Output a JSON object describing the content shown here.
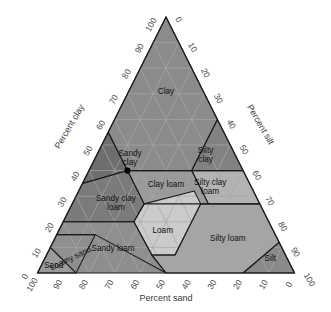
{
  "figure": {
    "kind": "soil-texture-triangle",
    "axes": {
      "bottom": {
        "title": "Percent sand",
        "ticks": [
          "100",
          "90",
          "80",
          "70",
          "60",
          "50",
          "40",
          "30",
          "20",
          "10",
          "0"
        ]
      },
      "left": {
        "title": "Percent clay",
        "ticks": [
          "0",
          "10",
          "20",
          "30",
          "40",
          "50",
          "60",
          "70",
          "80",
          "90",
          "100"
        ]
      },
      "right": {
        "title": "Percent silt",
        "ticks": [
          "0",
          "10",
          "20",
          "30",
          "40",
          "50",
          "60",
          "70",
          "80",
          "90",
          "100"
        ]
      }
    },
    "point": {
      "label": "A",
      "sand": 45,
      "silt": 15,
      "clay": 40
    },
    "colors": {
      "base": "#8e8e8e",
      "dark": "#6f6f6f",
      "mid": "#8a8a8a",
      "light": "#b9b9b9",
      "lightest": "#cfcfcf",
      "grid": "#a8a8a8",
      "outline": "#1d1d1d",
      "text": "#111111"
    }
  },
  "classes": [
    {
      "name": "Clay",
      "label": "Clay",
      "fill": "#8b8b8b",
      "lx": 0.5,
      "ly": 0.7,
      "lines": 1
    },
    {
      "name": "Sandy clay",
      "label": "Sandy clay",
      "fill": "#6e6e6e",
      "lx": 0.25,
      "ly": 0.44,
      "lines": 2
    },
    {
      "name": "Silty clay",
      "label": "Silty clay",
      "fill": "#828282",
      "lx": 0.78,
      "ly": 0.45,
      "lines": 2
    },
    {
      "name": "Clay loam",
      "label": "Clay loam",
      "fill": "#9a9a9a",
      "lx": 0.5,
      "ly": 0.335,
      "lines": 1
    },
    {
      "name": "Silty clay loam",
      "label": "Silty clay loam",
      "fill": "#b3b3b3",
      "lx": 0.755,
      "ly": 0.325,
      "lines": 2
    },
    {
      "name": "Sandy clay loam",
      "label": "Sandy clay loam",
      "fill": "#7b7b7b",
      "lx": 0.235,
      "ly": 0.265,
      "lines": 2
    },
    {
      "name": "Loam",
      "label": "Loam",
      "fill": "#cbcbcb",
      "lx": 0.485,
      "ly": 0.155,
      "lines": 1
    },
    {
      "name": "Silty loam",
      "label": "Silty loam",
      "fill": "#a5a5a5",
      "lx": 0.775,
      "ly": 0.125,
      "lines": 1
    },
    {
      "name": "Sandy loam",
      "label": "Sandy loam",
      "fill": "#8f8f8f",
      "lx": 0.275,
      "ly": 0.085,
      "lines": 1
    },
    {
      "name": "Silt",
      "label": "Silt",
      "fill": "#8a8a8a",
      "lx": 0.925,
      "ly": 0.045,
      "lines": 1
    },
    {
      "name": "Loamy sand",
      "label": "Loamy sand",
      "fill": "#8f8f8f",
      "lx": 0.115,
      "ly": 0.048,
      "lines": 1,
      "rot": -26
    },
    {
      "name": "Sand",
      "label": "Sand",
      "fill": "#9a9a9a",
      "lx": 0.055,
      "ly": 0.018,
      "lines": 1
    }
  ],
  "chart_data": {
    "type": "scatter",
    "title": "",
    "xlabel": "Percent sand",
    "ylabel": "Percent clay",
    "zlabel": "Percent silt",
    "ternary": true,
    "axis_ranges": {
      "sand": [
        0,
        100
      ],
      "silt": [
        0,
        100
      ],
      "clay": [
        0,
        100
      ]
    },
    "gridline_step": 10,
    "grid": true,
    "legend": "none",
    "points": [
      {
        "name": "A",
        "sand": 45,
        "silt": 15,
        "clay": 40
      }
    ],
    "regions": [
      {
        "name": "Clay",
        "vertices": [
          [
            0,
            0,
            100
          ],
          [
            0,
            40,
            60
          ],
          [
            20,
            40,
            40
          ],
          [
            45,
            15,
            40
          ],
          [
            45,
            0,
            55
          ]
        ]
      },
      {
        "name": "Sandy clay",
        "vertices": [
          [
            45,
            0,
            55
          ],
          [
            45,
            15,
            40
          ],
          [
            65,
            0,
            35
          ]
        ]
      },
      {
        "name": "Silty clay",
        "vertices": [
          [
            0,
            40,
            60
          ],
          [
            0,
            60,
            40
          ],
          [
            20,
            40,
            40
          ]
        ]
      },
      {
        "name": "Silty clay loam",
        "vertices": [
          [
            0,
            60,
            40
          ],
          [
            0,
            73,
            27
          ],
          [
            20,
            53,
            27
          ],
          [
            20,
            40,
            40
          ]
        ]
      },
      {
        "name": "Clay loam",
        "vertices": [
          [
            20,
            40,
            40
          ],
          [
            20,
            53,
            27
          ],
          [
            45,
            28,
            27
          ],
          [
            45,
            15,
            40
          ]
        ]
      },
      {
        "name": "Sandy clay loam",
        "vertices": [
          [
            45,
            15,
            40
          ],
          [
            45,
            28,
            27
          ],
          [
            52.5,
            27.5,
            20
          ],
          [
            80,
            0,
            20
          ],
          [
            65,
            0,
            35
          ]
        ]
      },
      {
        "name": "Loam",
        "vertices": [
          [
            23,
            45,
            32
          ],
          [
            45,
            28,
            27
          ],
          [
            52.5,
            27.5,
            20
          ],
          [
            52,
            41,
            7
          ],
          [
            43,
            50,
            7
          ],
          [
            23,
            50,
            27
          ]
        ]
      },
      {
        "name": "Silty loam",
        "vertices": [
          [
            0,
            73,
            27
          ],
          [
            0,
            88,
            12
          ],
          [
            20,
            80,
            0
          ],
          [
            50,
            50,
            0
          ],
          [
            52,
            41,
            7
          ],
          [
            43,
            50,
            7
          ],
          [
            23,
            50,
            27
          ],
          [
            20,
            53,
            27
          ]
        ]
      },
      {
        "name": "Silt",
        "vertices": [
          [
            0,
            88,
            12
          ],
          [
            0,
            100,
            0
          ],
          [
            20,
            80,
            0
          ]
        ]
      },
      {
        "name": "Sandy loam",
        "vertices": [
          [
            52.5,
            27.5,
            20
          ],
          [
            80,
            0,
            20
          ],
          [
            85,
            0,
            15
          ],
          [
            70,
            15,
            15
          ],
          [
            50,
            50,
            0
          ],
          [
            52,
            41,
            7
          ]
        ]
      },
      {
        "name": "Loamy sand",
        "vertices": [
          [
            85,
            0,
            15
          ],
          [
            90,
            0,
            10
          ],
          [
            85,
            15,
            0
          ],
          [
            70,
            15,
            15
          ]
        ]
      },
      {
        "name": "Sand",
        "vertices": [
          [
            90,
            0,
            10
          ],
          [
            100,
            0,
            0
          ],
          [
            85,
            15,
            0
          ]
        ]
      }
    ]
  }
}
